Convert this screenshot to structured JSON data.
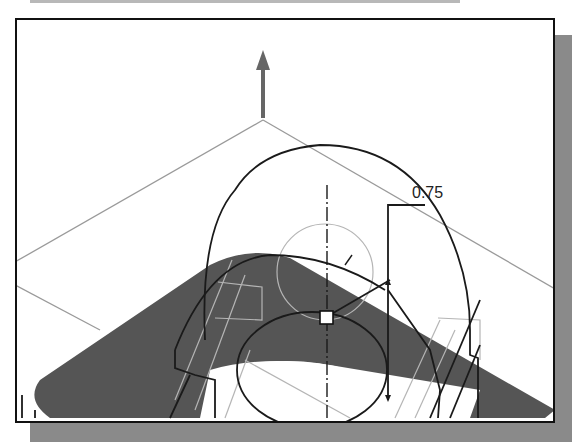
{
  "document": {
    "figure": "CAD sketch viewport with 3D part wireframe and shaded face",
    "colors": {
      "background": "#ffffff",
      "frame": "#111111",
      "shadow": "#8a8a8a",
      "shaded_face": "#555555",
      "construction_line": "#9a9a9a",
      "sketch_line": "#1a1a1a"
    }
  },
  "viewport": {
    "dimension_value": "0.75",
    "icons": {
      "z_axis_arrow": "arrow-up-icon",
      "sketch_point": "square-point-icon"
    }
  }
}
